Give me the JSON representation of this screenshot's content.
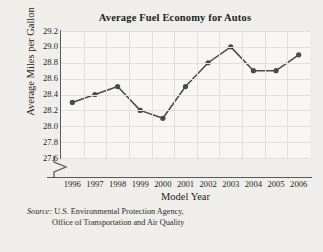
{
  "figure": {
    "background_color": "#efeeea",
    "plot_background_color": "#f7f6f3",
    "grid_color": "#e2e0db",
    "axis_color": "#5b5b5b",
    "series_color": "#4a4a4a"
  },
  "chart_data": {
    "type": "line",
    "title": "Average Fuel Economy for Autos",
    "xlabel": "Model Year",
    "ylabel": "Average Miles per Gallon",
    "categories": [
      "1996",
      "1997",
      "1998",
      "1999",
      "2000",
      "2001",
      "2002",
      "2003",
      "2004",
      "2005",
      "2006"
    ],
    "values": [
      28.3,
      28.4,
      28.5,
      28.2,
      28.1,
      28.5,
      28.8,
      29.0,
      28.7,
      28.7,
      28.9
    ],
    "ylim": [
      27.6,
      29.2
    ],
    "ytick_labels": [
      "29.2",
      "29.0",
      "28.8",
      "28.6",
      "28.4",
      "28.2",
      "28.0",
      "27.8",
      "27.6"
    ],
    "ytick_values": [
      29.2,
      29.0,
      28.8,
      28.6,
      28.4,
      28.2,
      28.0,
      27.8,
      27.6
    ],
    "grid": true,
    "y_axis_break": true,
    "legend": "none",
    "markers": true
  },
  "source": {
    "label": "Source:",
    "line1": "U.S. Environmental Protection Agency,",
    "line2": "Office of Transportation and Air Quality"
  }
}
